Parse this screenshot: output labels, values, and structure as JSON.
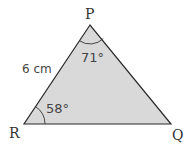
{
  "diagram": {
    "type": "triangle",
    "fill_color": "#d9d9d9",
    "stroke_color": "#2a2a2a",
    "vertices": [
      {
        "name": "P",
        "x": 90,
        "y": 25
      },
      {
        "name": "R",
        "x": 24,
        "y": 124
      },
      {
        "name": "Q",
        "x": 171,
        "y": 124
      }
    ],
    "labels": {
      "P": "P",
      "R": "R",
      "Q": "Q",
      "side_PR": "6 cm",
      "angle_P": "71°",
      "angle_R": "58°"
    }
  }
}
